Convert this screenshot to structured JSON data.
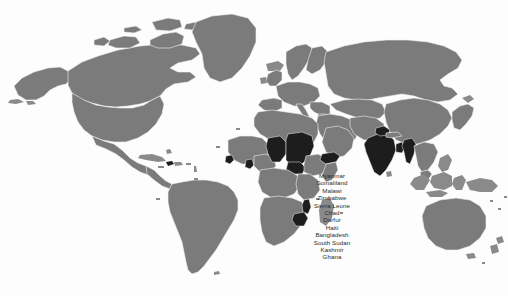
{
  "map": {
    "title": "world-map",
    "projection": "equirectangular",
    "background_color": "#fdfdfd",
    "land_color": "#7b7b7b",
    "highlight_color": "#1d1d1d",
    "border_color": "#f2f2f2"
  },
  "annotation_list": {
    "items": [
      {
        "label": "Myanmar"
      },
      {
        "label": "Somaliland"
      },
      {
        "label": "Malawi"
      },
      {
        "label": "Zimbabwe"
      },
      {
        "label": "Sierra Leone"
      },
      {
        "label": "Chad"
      },
      {
        "label": "Darfur"
      },
      {
        "label": "Haiti"
      },
      {
        "label": "Bangladesh"
      },
      {
        "label": "South Sudan"
      },
      {
        "label": "Kashmir"
      },
      {
        "label": "Ghana"
      }
    ]
  },
  "highlighted_regions": [
    {
      "name": "Myanmar"
    },
    {
      "name": "Somaliland"
    },
    {
      "name": "Malawi"
    },
    {
      "name": "Zimbabwe"
    },
    {
      "name": "Sierra Leone"
    },
    {
      "name": "Chad"
    },
    {
      "name": "Darfur"
    },
    {
      "name": "Haiti"
    },
    {
      "name": "Bangladesh"
    },
    {
      "name": "South Sudan"
    },
    {
      "name": "Kashmir"
    },
    {
      "name": "Ghana"
    },
    {
      "name": "India"
    }
  ]
}
